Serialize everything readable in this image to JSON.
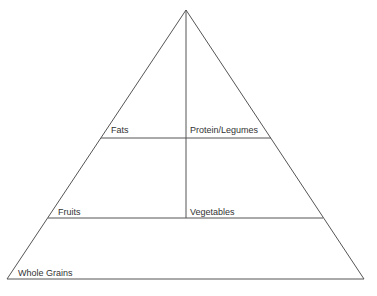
{
  "diagram": {
    "type": "food-pyramid",
    "colors": {
      "line": "#555555",
      "text": "#333333",
      "background": "#ffffff"
    },
    "tiers": [
      {
        "name": "top",
        "sections": [
          {
            "label": "Fats"
          },
          {
            "label": "Protein/Legumes"
          }
        ]
      },
      {
        "name": "middle",
        "sections": [
          {
            "label": "Fruits"
          },
          {
            "label": "Vegetables"
          }
        ]
      },
      {
        "name": "base",
        "sections": [
          {
            "label": "Whole Grains"
          }
        ]
      }
    ]
  }
}
